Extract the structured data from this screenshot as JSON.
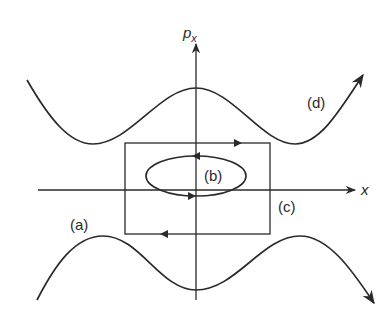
{
  "diagram": {
    "type": "phase-space",
    "axes": {
      "horizontal": {
        "label": "x"
      },
      "vertical": {
        "label": "p",
        "subscript": "x"
      }
    },
    "trajectories": [
      {
        "id": "a",
        "label": "(a)",
        "description": "lower wavy open trajectory, arrow pointing down-right"
      },
      {
        "id": "b",
        "label": "(b)",
        "description": "ellipse around origin, counter-clockwise arrows"
      },
      {
        "id": "c",
        "label": "(c)",
        "description": "rectangle loop, arrows right on top and left on bottom"
      },
      {
        "id": "d",
        "label": "(d)",
        "description": "upper wavy open trajectory, arrow pointing up-right"
      }
    ],
    "colors": {
      "ink": "#2a2a2a",
      "background": "#ffffff"
    }
  }
}
